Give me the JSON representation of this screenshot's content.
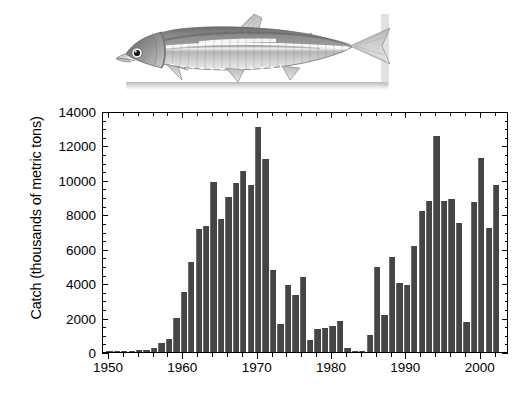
{
  "figure": {
    "illustration_name": "anchoveta-fish-illustration",
    "illustration_caption": "",
    "caption_partial": ""
  },
  "chart_data": {
    "type": "bar",
    "title": "",
    "xlabel": "",
    "ylabel": "Catch (thousands of metric tons)",
    "ylim": [
      0,
      14000
    ],
    "xlim": [
      1949.2,
      2003.8
    ],
    "grid": false,
    "legend": null,
    "bar_color": "#454545",
    "y_ticks": [
      0,
      2000,
      4000,
      6000,
      8000,
      10000,
      12000,
      14000
    ],
    "y_tick_labels": [
      "0",
      "2000",
      "4000",
      "6000",
      "8000",
      "10000",
      "12000",
      "14000"
    ],
    "y_minor_tick_step": 500,
    "x_ticks": [
      1950,
      1960,
      1970,
      1980,
      1990,
      2000
    ],
    "x_tick_labels": [
      "1950",
      "1960",
      "1970",
      "1980",
      "1990",
      "2000"
    ],
    "x_minor_tick_step": 2,
    "categories": [
      1950,
      1951,
      1952,
      1953,
      1954,
      1955,
      1956,
      1957,
      1958,
      1959,
      1960,
      1961,
      1962,
      1963,
      1964,
      1965,
      1966,
      1967,
      1968,
      1969,
      1970,
      1971,
      1972,
      1973,
      1974,
      1975,
      1976,
      1977,
      1978,
      1979,
      1980,
      1981,
      1982,
      1983,
      1984,
      1985,
      1986,
      1987,
      1988,
      1989,
      1990,
      1991,
      1992,
      1993,
      1994,
      1995,
      1996,
      1997,
      1998,
      1999,
      2000,
      2001,
      2002,
      2003
    ],
    "values": [
      10,
      20,
      50,
      70,
      90,
      120,
      250,
      500,
      750,
      1950,
      3500,
      5250,
      7150,
      7300,
      9900,
      7700,
      9000,
      9800,
      10500,
      9700,
      13050,
      11200,
      4750,
      1600,
      3900,
      3300,
      4350,
      700,
      1350,
      1400,
      1500,
      1800,
      250,
      40,
      20,
      1000,
      4950,
      2150,
      5500,
      4000,
      3900,
      6150,
      8200,
      8800,
      12550,
      8800,
      8900,
      7500,
      1750,
      8700,
      11250,
      7200,
      9700,
      0
    ],
    "annotations": [],
    "notes": ""
  }
}
